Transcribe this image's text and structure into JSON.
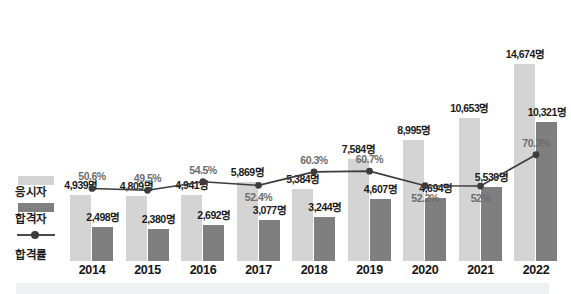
{
  "legend": {
    "items": [
      {
        "key": "applicants",
        "label": "응시자",
        "color": "#d4d4d4",
        "marker": "bar-swatch"
      },
      {
        "key": "passers",
        "label": "합격자",
        "color": "#7f7f7f",
        "marker": "bar-swatch"
      },
      {
        "key": "rate",
        "label": "합격률",
        "color": "#3c3c3c",
        "marker": "line-marker"
      }
    ]
  },
  "chart_data": {
    "type": "bar",
    "title": "",
    "subtitle": "",
    "xlabel": "",
    "ylabel": "",
    "grid": false,
    "legend_position": "left",
    "categories": [
      "2014",
      "2015",
      "2016",
      "2017",
      "2018",
      "2019",
      "2020",
      "2021",
      "2022"
    ],
    "ylim": [
      0,
      16000
    ],
    "y2lim": [
      0,
      100
    ],
    "series": [
      {
        "name": "응시자",
        "type": "bar",
        "color": "#d4d4d4",
        "unit": "명",
        "values": [
          4939,
          4809,
          4941,
          5869,
          5384,
          7584,
          8995,
          10653,
          14674
        ],
        "labels": [
          "4,939명",
          "4,809명",
          "4,941명",
          "5,869명",
          "5,384명",
          "7,584명",
          "8,995명",
          "10,653명",
          "14,674명"
        ]
      },
      {
        "name": "합격자",
        "type": "bar",
        "color": "#7f7f7f",
        "unit": "명",
        "values": [
          2498,
          2380,
          2692,
          3077,
          3244,
          4607,
          4694,
          5539,
          10321
        ],
        "labels": [
          "2,498명",
          "2,380명",
          "2,692명",
          "3,077명",
          "3,244명",
          "4,607명",
          "4,694명",
          "5,539명",
          "10,321명"
        ]
      },
      {
        "name": "합격률",
        "type": "line",
        "color": "#3c3c3c",
        "unit": "%",
        "values": [
          50.6,
          49.5,
          54.5,
          52.4,
          60.3,
          60.7,
          52.2,
          52.0,
          70.3
        ],
        "labels": [
          "50.6%",
          "49.5%",
          "54.5%",
          "52.4%",
          "60.3%",
          "60.7%",
          "52.2%",
          "52%",
          "70.3%"
        ],
        "label_positions": [
          "above",
          "above",
          "above",
          "below",
          "above",
          "above",
          "below",
          "below",
          "above"
        ]
      }
    ]
  }
}
